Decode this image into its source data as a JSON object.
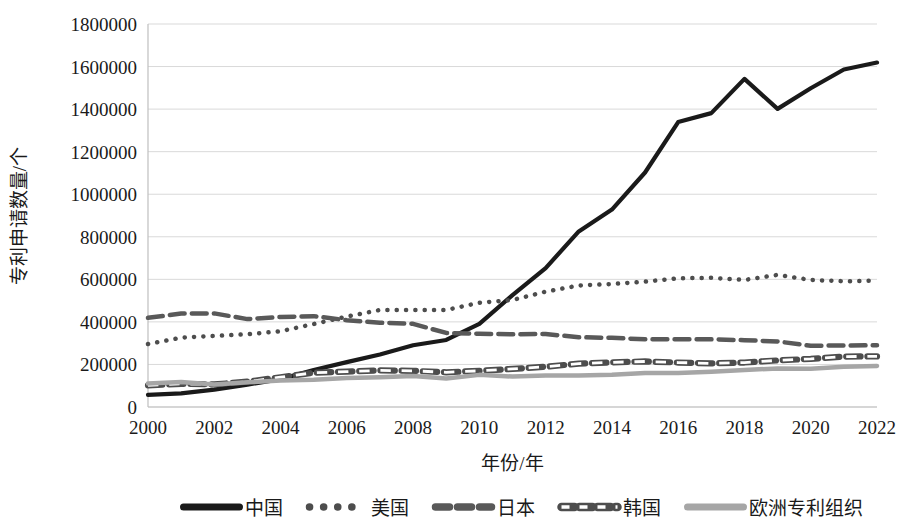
{
  "chart_data": {
    "type": "line",
    "title": "",
    "xlabel": "年份/年",
    "ylabel": "专利申请数量/个",
    "xlim": [
      2000,
      2022
    ],
    "ylim": [
      0,
      1800000
    ],
    "ytick_step": 200000,
    "grid": true,
    "legend_position": "bottom",
    "x": [
      2000,
      2001,
      2002,
      2003,
      2004,
      2005,
      2006,
      2007,
      2008,
      2009,
      2010,
      2011,
      2012,
      2013,
      2014,
      2015,
      2016,
      2017,
      2018,
      2019,
      2020,
      2021,
      2022
    ],
    "xticks": [
      "2000",
      "2002",
      "2004",
      "2006",
      "2008",
      "2010",
      "2012",
      "2014",
      "2016",
      "2018",
      "2020",
      "2022"
    ],
    "yticks": [
      "0",
      "200000",
      "400000",
      "600000",
      "800000",
      "1000000",
      "1200000",
      "1400000",
      "1600000",
      "1800000"
    ],
    "series": [
      {
        "name": "中国",
        "style": "solid",
        "color": "#1a1a1a",
        "width": 4.2,
        "values": [
          57000,
          64000,
          82000,
          105000,
          131000,
          174000,
          211000,
          247000,
          290000,
          315000,
          391000,
          526000,
          653000,
          825000,
          928000,
          1102000,
          1339000,
          1381000,
          1542000,
          1401000,
          1498000,
          1586000,
          1619000
        ]
      },
      {
        "name": "美国",
        "style": "dotted",
        "color": "#4d4d4d",
        "width": 4.5,
        "values": [
          296000,
          326000,
          334000,
          342000,
          356000,
          390000,
          425000,
          456000,
          456000,
          456000,
          490000,
          503000,
          542000,
          571000,
          578000,
          589000,
          605000,
          607000,
          597000,
          621000,
          597000,
          591000,
          594000
        ]
      },
      {
        "name": "日本",
        "style": "dashed",
        "color": "#595959",
        "width": 4.5,
        "values": [
          419000,
          439000,
          440000,
          413000,
          423000,
          427000,
          408000,
          396000,
          391000,
          348000,
          344000,
          342000,
          343000,
          328000,
          325000,
          318000,
          318000,
          318000,
          314000,
          308000,
          288000,
          289000,
          290000
        ]
      },
      {
        "name": "韩国",
        "style": "open-dash",
        "color": "#4d4d4d",
        "width": 4.0,
        "values": [
          102000,
          109000,
          106000,
          119000,
          140000,
          161000,
          166000,
          172000,
          170000,
          163000,
          170000,
          179000,
          189000,
          204000,
          210000,
          214000,
          209000,
          205000,
          209000,
          219000,
          226000,
          237000,
          238000
        ]
      },
      {
        "name": "欧洲专利组织",
        "style": "solid",
        "color": "#a6a6a6",
        "width": 4.5,
        "values": [
          110000,
          118000,
          106000,
          116000,
          124000,
          128000,
          136000,
          140000,
          146000,
          134000,
          151000,
          143000,
          148000,
          148000,
          152000,
          160000,
          160000,
          166000,
          174000,
          181000,
          180000,
          189000,
          193000
        ]
      }
    ]
  },
  "legend": {
    "items": [
      {
        "label": "中国",
        "style": "solid",
        "color": "#1a1a1a"
      },
      {
        "label": "美国",
        "style": "dotted",
        "color": "#4d4d4d"
      },
      {
        "label": "日本",
        "style": "dashed",
        "color": "#595959"
      },
      {
        "label": "韩国",
        "style": "open-dash",
        "color": "#4d4d4d"
      },
      {
        "label": "欧洲专利组织",
        "style": "solid",
        "color": "#a6a6a6"
      }
    ]
  },
  "axes": {
    "y_title": "专利申请数量/个",
    "x_title": "年份/年"
  }
}
